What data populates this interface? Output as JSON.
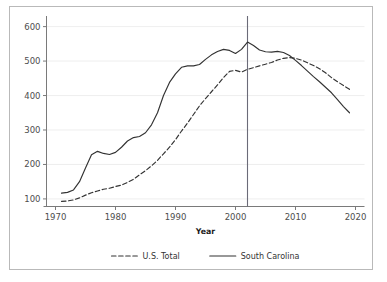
{
  "chart_data": {
    "type": "line",
    "title": "",
    "xlabel": "Year",
    "ylabel": "",
    "xlim": [
      1968.5,
      2021.5
    ],
    "ylim": [
      78,
      625
    ],
    "xticks": [
      1970,
      1980,
      1990,
      2000,
      2010,
      2020
    ],
    "xticklabels": [
      "1970",
      "1980",
      "1990",
      "2000",
      "2010",
      "2020"
    ],
    "yticks": [
      100,
      200,
      300,
      400,
      500,
      600
    ],
    "yticklabels": [
      "100",
      "200",
      "300",
      "400",
      "500",
      "600"
    ],
    "grid": true,
    "grid_axis": "y",
    "legend_position": "below",
    "annotations": [
      {
        "type": "vline",
        "x": 2002,
        "label": ""
      }
    ],
    "series": [
      {
        "name": "U.S. Total",
        "style": "dashed",
        "color": "#333333",
        "x": [
          1971,
          1972,
          1973,
          1974,
          1975,
          1976,
          1977,
          1978,
          1979,
          1980,
          1981,
          1982,
          1983,
          1984,
          1985,
          1986,
          1987,
          1988,
          1989,
          1990,
          1991,
          1992,
          1993,
          1994,
          1995,
          1996,
          1997,
          1998,
          1999,
          2000,
          2001,
          2002,
          2003,
          2004,
          2005,
          2006,
          2007,
          2008,
          2009,
          2010,
          2011,
          2012,
          2013,
          2014,
          2015,
          2016,
          2017,
          2018,
          2019
        ],
        "values": [
          93,
          94,
          97,
          103,
          111,
          118,
          123,
          128,
          131,
          136,
          140,
          148,
          157,
          170,
          182,
          196,
          212,
          231,
          250,
          272,
          297,
          320,
          345,
          370,
          391,
          411,
          431,
          452,
          470,
          473,
          468,
          476,
          481,
          486,
          491,
          496,
          503,
          508,
          510,
          508,
          503,
          495,
          487,
          478,
          466,
          452,
          440,
          429,
          418
        ]
      },
      {
        "name": "South Carolina",
        "style": "solid",
        "color": "#333333",
        "x": [
          1971,
          1972,
          1973,
          1974,
          1975,
          1976,
          1977,
          1978,
          1979,
          1980,
          1981,
          1982,
          1983,
          1984,
          1985,
          1986,
          1987,
          1988,
          1989,
          1990,
          1991,
          1992,
          1993,
          1994,
          1995,
          1996,
          1997,
          1998,
          1999,
          2000,
          2001,
          2002,
          2003,
          2004,
          2005,
          2006,
          2007,
          2008,
          2009,
          2010,
          2011,
          2012,
          2013,
          2014,
          2015,
          2016,
          2017,
          2018,
          2019
        ],
        "values": [
          117,
          119,
          126,
          150,
          190,
          228,
          238,
          232,
          229,
          235,
          250,
          268,
          278,
          281,
          292,
          315,
          350,
          400,
          438,
          463,
          482,
          486,
          486,
          490,
          505,
          518,
          528,
          534,
          531,
          522,
          534,
          555,
          545,
          532,
          527,
          526,
          528,
          525,
          516,
          502,
          487,
          471,
          455,
          440,
          424,
          408,
          388,
          368,
          350
        ]
      }
    ]
  },
  "legend": {
    "items": [
      {
        "label": "U.S. Total",
        "style": "dashed"
      },
      {
        "label": "South Carolina",
        "style": "solid"
      }
    ]
  }
}
